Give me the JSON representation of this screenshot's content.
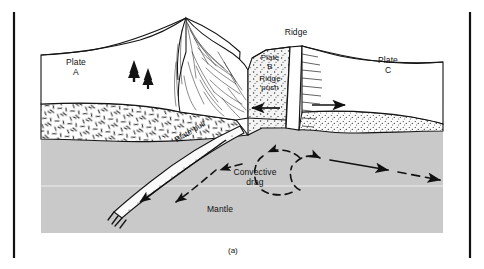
{
  "figure": {
    "caption": "(a)",
    "kind": "cross-section-diagram"
  },
  "colors": {
    "ink": "#141414",
    "mantle_fill": "#c9c9c9",
    "crust_left_fill": "#ffffff",
    "crust_right_fill": "#f2f2f2",
    "plate_surface_fill": "#ffffff",
    "page_bg": "#ffffff",
    "rule": "#111111"
  },
  "labels": {
    "plate_a": "Plate\nA",
    "plate_b": "Plate\nB",
    "plate_c": "Plate\nC",
    "ridge": "Ridge",
    "ridge_push": "Ridge\npush",
    "plate_pull": "Plate pull",
    "convective_drag": "Convective\ndrag",
    "mantle": "Mantle"
  },
  "features": {
    "mountains": "folded-mountain-range",
    "trees": "conifer-trees",
    "slab": "subducting-slab",
    "ridge_axis": "spreading-ridge-axis",
    "left_crust_texture": "dash-hatch",
    "right_crust_texture": "stipple-dots"
  },
  "arrows": {
    "ridge_push_left": "solid-arrow-left",
    "ridge_push_right": "solid-arrow-right",
    "slab_pull": "solid-arrow-down-left",
    "convection_left_cell": "dashed-loop-counterclockwise",
    "convection_right_cell": "dashed-loop-clockwise",
    "mantle_flow_right": "solid-and-dashed-arrow-right"
  },
  "frame": {
    "left_rule": true,
    "right_rule": true
  }
}
